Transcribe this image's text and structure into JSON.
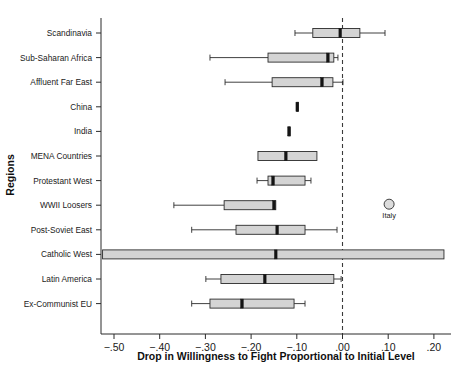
{
  "chart_data": {
    "type": "bar",
    "subtype": "horizontal-boxplot",
    "title": "",
    "xlabel": "Drop in Willingness to Fight Proportional to Initial Level",
    "ylabel": "Regions",
    "xlim": [
      -0.535,
      0.245
    ],
    "ylim": [
      0,
      12
    ],
    "grid": false,
    "legend": null,
    "xticks": [
      -0.5,
      -0.4,
      -0.3,
      -0.2,
      -0.1,
      0.0,
      0.1,
      0.2
    ],
    "xticklabels": [
      "−.50",
      "−.40",
      "−.30",
      "−.20",
      "−.10",
      ".00",
      ".10",
      ".20"
    ],
    "reference_line": {
      "x": 0.0,
      "style": "dashed"
    },
    "categories": [
      "Scandinavia",
      "Sub-Saharan Africa",
      "Affluent Far East",
      "China",
      "India",
      "MENA Countries",
      "Protestant West",
      "WWII Loosers",
      "Post-Soviet East",
      "Catholic West",
      "Latin America",
      "Ex-Communist EU"
    ],
    "boxes": [
      {
        "category": "Scandinavia",
        "whisker_low": -0.104,
        "q1": -0.065,
        "median": -0.005,
        "q3": 0.038,
        "whisker_high": 0.093
      },
      {
        "category": "Sub-Saharan Africa",
        "whisker_low": -0.29,
        "q1": -0.163,
        "median": -0.032,
        "q3": -0.019,
        "whisker_high": -0.01
      },
      {
        "category": "Affluent Far East",
        "whisker_low": -0.257,
        "q1": -0.154,
        "median": -0.045,
        "q3": -0.021,
        "whisker_high": 0.001
      },
      {
        "category": "China",
        "whisker_low": -0.1,
        "q1": -0.1,
        "median": -0.099,
        "q3": -0.097,
        "whisker_high": -0.097
      },
      {
        "category": "India",
        "whisker_low": -0.118,
        "q1": -0.118,
        "median": -0.117,
        "q3": -0.115,
        "whisker_high": -0.115
      },
      {
        "category": "MENA Countries",
        "whisker_low": -0.185,
        "q1": -0.185,
        "median": -0.124,
        "q3": -0.056,
        "whisker_high": -0.056
      },
      {
        "category": "Protestant West",
        "whisker_low": -0.187,
        "q1": -0.163,
        "median": -0.152,
        "q3": -0.082,
        "whisker_high": -0.069
      },
      {
        "category": "WWII Loosers",
        "whisker_low": -0.369,
        "q1": -0.259,
        "median": -0.15,
        "q3": -0.146,
        "whisker_high": -0.146
      },
      {
        "category": "Post-Soviet East",
        "whisker_low": -0.33,
        "q1": -0.233,
        "median": -0.143,
        "q3": -0.082,
        "whisker_high": -0.012
      },
      {
        "category": "Catholic West",
        "whisker_low": -0.525,
        "q1": -0.525,
        "median": -0.146,
        "q3": 0.222,
        "whisker_high": 0.222
      },
      {
        "category": "Latin America",
        "whisker_low": -0.299,
        "q1": -0.266,
        "median": -0.17,
        "q3": -0.019,
        "whisker_high": -0.003
      },
      {
        "category": "Ex-Communist EU",
        "whisker_low": -0.33,
        "q1": -0.29,
        "median": -0.22,
        "q3": -0.106,
        "whisker_high": -0.082
      }
    ],
    "outliers": [
      {
        "category": "WWII Loosers",
        "x": 0.102,
        "label": "Italy"
      }
    ]
  },
  "axis": {
    "x_title": "Drop in Willingness to Fight Proportional to Initial Level",
    "y_title": "Regions"
  },
  "colors": {
    "box_fill": "#d4d4d4",
    "line": "#2b2b2b",
    "median": "#141414",
    "background": "#ffffff"
  }
}
